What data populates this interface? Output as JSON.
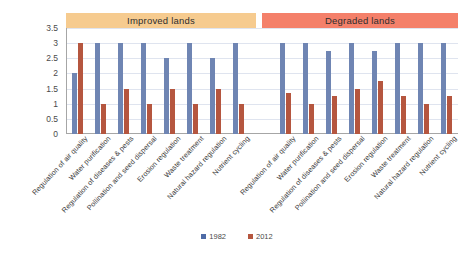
{
  "chart_data": {
    "type": "bar",
    "title": "",
    "xlabel": "",
    "ylabel": "",
    "ylim": [
      0,
      3.5
    ],
    "ytick_step": 0.5,
    "yticks": [
      "3.5",
      "3",
      "2.5",
      "2",
      "1.5",
      "1",
      "0.5",
      "0"
    ],
    "grid": true,
    "legend_position": "bottom-center",
    "legend": [
      "1982",
      "2012"
    ],
    "series_colors": {
      "1982": "#6F85B3",
      "2012": "#B5563F"
    },
    "categories": [
      "Regulation of air quality",
      "Water purification",
      "Regulation of diseases & pests",
      "Pollination and seed dispersal",
      "Erosion regulation",
      "Waste treatment",
      "Natural hazard regulation",
      "Nutrient cycling"
    ],
    "panels": [
      {
        "name": "Improved lands",
        "banner_color": "#F6CB8F",
        "categories": [
          "Regulation of air quality",
          "Water purification",
          "Regulation of diseases & pests",
          "Pollination and seed dispersal",
          "Erosion regulation",
          "Waste treatment",
          "Natural hazard regulation",
          "Nutrient cycling"
        ],
        "series": [
          {
            "name": "1982",
            "values": [
              2,
              3,
              3,
              3,
              2.5,
              3,
              2.5,
              3
            ]
          },
          {
            "name": "2012",
            "values": [
              3,
              1,
              1.5,
              1,
              1.5,
              1,
              1.5,
              1
            ]
          }
        ]
      },
      {
        "name": "Degraded lands",
        "banner_color": "#F4806A",
        "categories": [
          "Regulation of air quality",
          "Water purification",
          "Regulation of diseases & pests",
          "Pollination and seed dispersal",
          "Erosion regulation",
          "Waste treatment",
          "Natural hazard regulation",
          "Nutrient cycling"
        ],
        "series": [
          {
            "name": "1982",
            "values": [
              3,
              3,
              2.75,
              3,
              2.75,
              3,
              3,
              3
            ]
          },
          {
            "name": "2012",
            "values": [
              1.35,
              1,
              1.25,
              1.5,
              1.75,
              1.25,
              1,
              1.25
            ]
          }
        ]
      }
    ]
  }
}
